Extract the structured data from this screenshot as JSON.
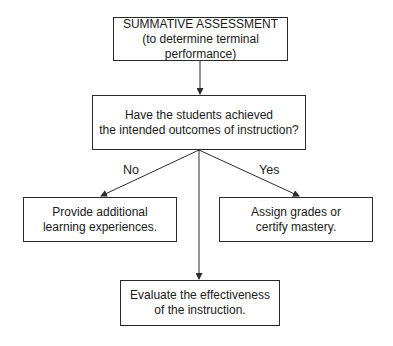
{
  "diagram": {
    "type": "flowchart",
    "nodes": {
      "summative": {
        "line1": "SUMMATIVE ASSESSMENT",
        "line2": "(to determine terminal performance)"
      },
      "question": {
        "line1": "Have the students achieved",
        "line2": "the intended outcomes of instruction?"
      },
      "no_branch": {
        "line1": "Provide additional",
        "line2": "learning experiences."
      },
      "yes_branch": {
        "line1": "Assign grades or",
        "line2": "certify mastery."
      },
      "evaluate": {
        "line1": "Evaluate the effectiveness",
        "line2": "of the instruction."
      }
    },
    "edge_labels": {
      "no": "No",
      "yes": "Yes"
    },
    "edges": [
      {
        "from": "summative",
        "to": "question"
      },
      {
        "from": "question",
        "to": "no_branch",
        "label": "No"
      },
      {
        "from": "question",
        "to": "yes_branch",
        "label": "Yes"
      },
      {
        "from": "question",
        "to": "evaluate"
      }
    ],
    "colors": {
      "stroke": "#2a2a2a",
      "background": "#ffffff"
    }
  }
}
